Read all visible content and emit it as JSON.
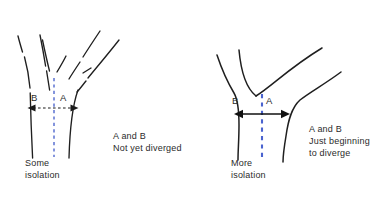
{
  "figure": {
    "panels": [
      {
        "id": "left",
        "name": "some-isolation-panel",
        "axis_label_left": "B",
        "axis_label_right": "A",
        "caption": "Some\nisolation",
        "note": "A and B\nNot yet diverged",
        "divider_style": "dashed",
        "arrow_style": "dashed",
        "divider_color": "#3a55c8",
        "arrow_color": "#1a1a1a",
        "curve_color": "#1f1f1f"
      },
      {
        "id": "right",
        "name": "more-isolation-panel",
        "axis_label_left": "B",
        "axis_label_right": "A",
        "caption": "More\nisolation",
        "note": "A and B\nJust beginning\nto diverge",
        "divider_style": "dashed",
        "arrow_style": "solid",
        "divider_color": "#4a63cf",
        "arrow_color": "#111111",
        "curve_color": "#1f1f1f"
      }
    ],
    "background_color": "#ffffff"
  }
}
